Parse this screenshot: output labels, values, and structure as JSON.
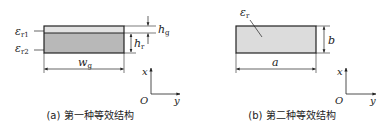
{
  "figure_a": {
    "caption": "(a) 第一种等效结构",
    "layer1_label": {
      "sym": "ε",
      "sub": "r1"
    },
    "layer2_label": {
      "sym": "ε",
      "sub": "r2"
    },
    "dim_top_height": {
      "sym": "h",
      "sub": "g"
    },
    "dim_layer_height": {
      "sym": "h",
      "sub": "r"
    },
    "dim_width": {
      "sym": "w",
      "sub": "g"
    },
    "axis_x": "x",
    "axis_y": "y",
    "origin": "O",
    "colors": {
      "layer1_fill": "#e2e2e2",
      "layer2_fill": "#b8b8b8",
      "stroke": "#222222"
    }
  },
  "figure_b": {
    "caption": "(b) 第二种等效结构",
    "material_label": {
      "sym": "ε",
      "sub": "r"
    },
    "dim_height": "b",
    "dim_width": "a",
    "axis_x": "x",
    "axis_y": "y",
    "origin": "O",
    "colors": {
      "fill": "#dcdcdc",
      "stroke": "#222222"
    }
  }
}
